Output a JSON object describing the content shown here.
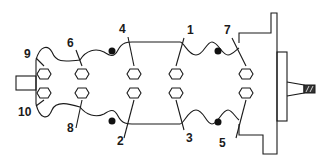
{
  "diagram": {
    "colors": {
      "line": "#1a1a1a",
      "background": "#ffffff",
      "hatch": "#333333"
    },
    "labels": {
      "b1": "1",
      "b2": "2",
      "b3": "3",
      "b4": "4",
      "b5": "5",
      "b6": "6",
      "b7": "7",
      "b8": "8",
      "b9": "9",
      "b10": "10"
    },
    "bolt_count": 10,
    "rows": {
      "top": [
        "9",
        "6",
        "4",
        "1",
        "7"
      ],
      "bottom": [
        "10",
        "8",
        "2",
        "3",
        "5"
      ]
    },
    "icons": {
      "bolt": "hexagon-bolt-icon",
      "dowel": "filled-dot-dowel-icon",
      "hatched_plug": "hatched-end-icon"
    }
  }
}
